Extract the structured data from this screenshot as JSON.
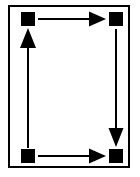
{
  "figure": {
    "background_color": "#ffffff",
    "ink_color": "#000000",
    "frame": {
      "name": "outer-border",
      "x": 8,
      "y": 5,
      "width": 122,
      "height": 163,
      "stroke_width": 2,
      "fill": "#ffffff",
      "stroke": "#000000"
    },
    "nodes": [
      {
        "id": "top-left",
        "label": "",
        "cx": 28,
        "cy": 19,
        "size": 14,
        "color": "#000000"
      },
      {
        "id": "top-right",
        "label": "",
        "cx": 116,
        "cy": 19,
        "size": 14,
        "color": "#000000"
      },
      {
        "id": "bottom-right",
        "label": "",
        "cx": 116,
        "cy": 156,
        "size": 14,
        "color": "#000000"
      },
      {
        "id": "bottom-left",
        "label": "",
        "cx": 28,
        "cy": 156,
        "size": 14,
        "color": "#000000"
      }
    ],
    "arrows": [
      {
        "id": "top-edge",
        "from": "top-left",
        "to": "top-right",
        "direction": "right",
        "x1": 38,
        "y1": 19,
        "x2": 106,
        "y2": 19,
        "shaft_width": 2,
        "head_length": 17,
        "head_width": 15,
        "color": "#000000"
      },
      {
        "id": "right-edge",
        "from": "top-right",
        "to": "bottom-right",
        "direction": "down",
        "x1": 116,
        "y1": 29,
        "x2": 116,
        "y2": 147,
        "shaft_width": 2,
        "head_length": 19,
        "head_width": 15,
        "color": "#000000"
      },
      {
        "id": "bottom-edge",
        "from": "bottom-left",
        "to": "bottom-right",
        "direction": "right",
        "x1": 38,
        "y1": 156,
        "x2": 106,
        "y2": 156,
        "shaft_width": 2,
        "head_length": 17,
        "head_width": 15,
        "color": "#000000"
      },
      {
        "id": "left-edge",
        "from": "bottom-left",
        "to": "top-left",
        "direction": "up",
        "x1": 28,
        "y1": 148,
        "x2": 28,
        "y2": 28,
        "shaft_width": 2,
        "head_length": 20,
        "head_width": 16,
        "color": "#000000"
      }
    ]
  }
}
